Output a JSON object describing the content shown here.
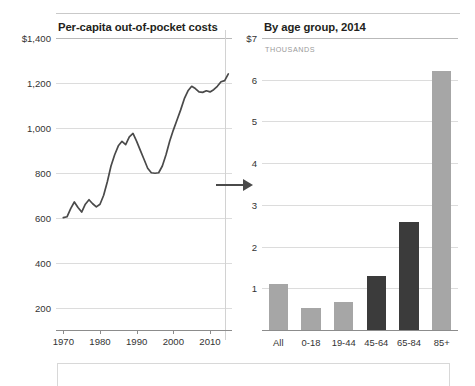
{
  "figure": {
    "top_rule": true,
    "accent_dark": "#3b3b3b",
    "accent_light": "#a6a6a6",
    "line_color": "#4a4a4a"
  },
  "left_panel": {
    "title": "Per-capita out-of-pocket costs",
    "arrow_icon": "arrow-right-icon"
  },
  "right_panel": {
    "title": "By age group, 2014",
    "subtitle": "THOUSANDS"
  },
  "chart_data": [
    {
      "type": "line",
      "title": "Per-capita out-of-pocket costs",
      "xlabel": "",
      "ylabel": "",
      "ylim": [
        100,
        1400
      ],
      "xlim": [
        1968,
        2016
      ],
      "grid": true,
      "legend": "none",
      "ytick_labels": [
        "$1,400",
        "1,200",
        "1,000",
        "800",
        "600",
        "400",
        "200"
      ],
      "yticks": [
        1400,
        1200,
        1000,
        800,
        600,
        400,
        200
      ],
      "xtick_labels": [
        "1970",
        "1980",
        "1990",
        "2000",
        "2010"
      ],
      "xticks": [
        1970,
        1980,
        1990,
        2000,
        2010
      ],
      "annotation_vline_x": 2014,
      "x": [
        1970,
        1971,
        1972,
        1973,
        1974,
        1975,
        1976,
        1977,
        1978,
        1979,
        1980,
        1981,
        1982,
        1983,
        1984,
        1985,
        1986,
        1987,
        1988,
        1989,
        1990,
        1991,
        1992,
        1993,
        1994,
        1995,
        1996,
        1997,
        1998,
        1999,
        2000,
        2001,
        2002,
        2003,
        2004,
        2005,
        2006,
        2007,
        2008,
        2009,
        2010,
        2011,
        2012,
        2013,
        2014,
        2015
      ],
      "y": [
        600,
        604,
        640,
        670,
        645,
        625,
        660,
        680,
        662,
        648,
        660,
        700,
        760,
        830,
        880,
        920,
        940,
        925,
        960,
        975,
        940,
        900,
        860,
        820,
        800,
        798,
        800,
        830,
        880,
        940,
        990,
        1035,
        1080,
        1130,
        1165,
        1185,
        1175,
        1160,
        1158,
        1165,
        1160,
        1170,
        1185,
        1205,
        1210,
        1240
      ]
    },
    {
      "type": "bar",
      "title": "By age group, 2014",
      "subtitle": "THOUSANDS",
      "xlabel": "",
      "ylabel": "",
      "ylim": [
        0,
        7
      ],
      "grid": true,
      "legend": "none",
      "ytick_labels": [
        "$7",
        "6",
        "5",
        "4",
        "3",
        "2",
        "1"
      ],
      "yticks": [
        7,
        6,
        5,
        4,
        3,
        2,
        1
      ],
      "categories": [
        "All",
        "0-18",
        "19-44",
        "45-64",
        "65-84",
        "85+"
      ],
      "values": [
        1.1,
        0.52,
        0.68,
        1.3,
        2.6,
        6.2
      ],
      "colors": [
        "#a6a6a6",
        "#a6a6a6",
        "#a6a6a6",
        "#3b3b3b",
        "#3b3b3b",
        "#a6a6a6"
      ]
    }
  ]
}
